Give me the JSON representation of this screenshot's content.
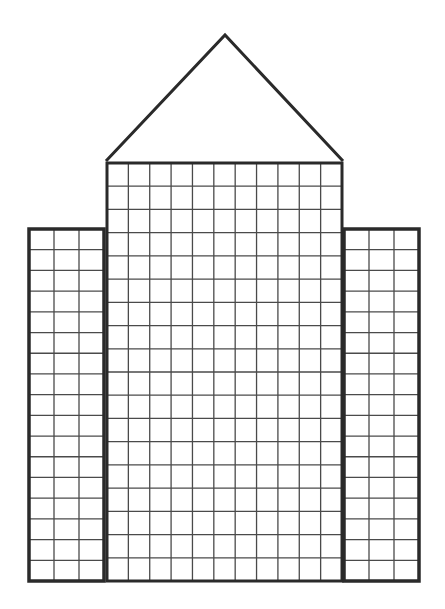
{
  "colors": {
    "stroke": "#2a2a2a",
    "grid": "#4a4a4a",
    "background": "#ffffff"
  },
  "drawing": {
    "roof": {
      "shape": "triangle"
    },
    "center_tower": {
      "columns": 11,
      "rows": 18
    },
    "left_tower": {
      "columns": 3,
      "rows": 17
    },
    "right_tower": {
      "columns": 3,
      "rows": 17
    }
  }
}
